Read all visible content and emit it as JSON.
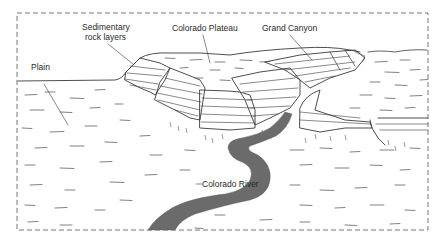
{
  "diagram": {
    "labels": {
      "sedimentary_line1": "Sedimentary",
      "sedimentary_line2": "rock layers",
      "plateau": "Colorado Plateau",
      "canyon": "Grand Canyon",
      "plain": "Plain",
      "river": "Colorado River"
    },
    "colors": {
      "ink": "#3a3a3a",
      "river": "#6b6b6b",
      "border": "#777777",
      "background": "#ffffff"
    }
  }
}
